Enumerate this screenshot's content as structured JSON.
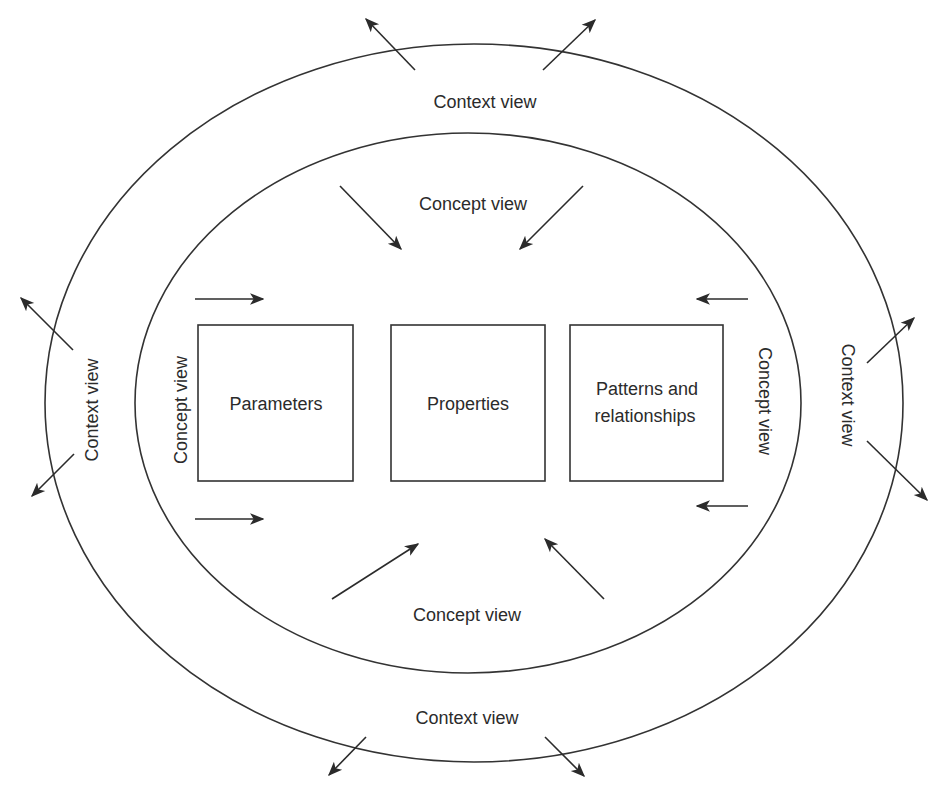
{
  "diagram": {
    "outer_ring": {
      "labels": {
        "top": "Context view",
        "bottom": "Context view",
        "left": "Context view",
        "right": "Context view"
      },
      "arrow_direction": "outward"
    },
    "inner_ring": {
      "labels": {
        "top": "Concept view",
        "bottom": "Concept view",
        "left": "Concept view",
        "right": "Concept view"
      },
      "arrow_direction": "inward"
    },
    "boxes": [
      {
        "label": "Parameters"
      },
      {
        "label": "Properties"
      },
      {
        "label_line1": "Patterns and",
        "label_line2": "relationships"
      }
    ],
    "colors": {
      "stroke": "#333333",
      "text": "#2b2b2b",
      "background": "#ffffff"
    }
  }
}
